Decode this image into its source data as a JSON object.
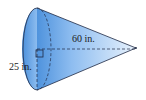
{
  "figure": {
    "shape": "cone",
    "height_label": "60 in.",
    "radius_label": "25 in.",
    "colors": {
      "fill_light": "#d6e8f8",
      "fill_dark": "#5b9be0",
      "stroke": "#1f2a44"
    }
  }
}
